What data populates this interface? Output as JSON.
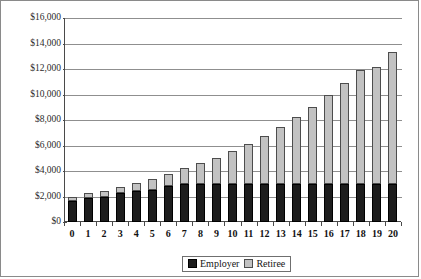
{
  "chart_data": {
    "type": "bar",
    "stacked": true,
    "title": "",
    "xlabel": "",
    "ylabel": "",
    "categories": [
      "0",
      "1",
      "2",
      "3",
      "4",
      "5",
      "6",
      "7",
      "8",
      "9",
      "10",
      "11",
      "12",
      "13",
      "14",
      "15",
      "16",
      "17",
      "18",
      "19",
      "20"
    ],
    "series": [
      {
        "name": "Employer",
        "color": "#1d1d1d",
        "values": [
          1650,
          1900,
          1950,
          2300,
          2450,
          2550,
          2850,
          2950,
          3000,
          3000,
          3000,
          3000,
          3000,
          3000,
          3000,
          3000,
          3000,
          3000,
          3000,
          3000,
          3000
        ]
      },
      {
        "name": "Retiree",
        "color": "#c2c2c2",
        "values": [
          300,
          350,
          450,
          450,
          600,
          850,
          900,
          1250,
          1650,
          2000,
          2550,
          3100,
          3750,
          4450,
          5250,
          6050,
          6950,
          7900,
          8900,
          9150,
          10350
        ]
      }
    ],
    "totals": [
      1950,
      2250,
      2400,
      2750,
      3050,
      3400,
      3750,
      4200,
      4650,
      5000,
      5550,
      6100,
      6750,
      7450,
      8250,
      9050,
      9950,
      10900,
      11900,
      12150,
      13350
    ],
    "ylim": [
      0,
      16000
    ],
    "ytick_values": [
      0,
      2000,
      4000,
      6000,
      8000,
      10000,
      12000,
      14000,
      16000
    ],
    "ytick_labels": [
      "$0",
      "$2,000",
      "$4,000",
      "$6,000",
      "$8,000",
      "$10,000",
      "$12,000",
      "$14,000",
      "$16,000"
    ],
    "grid": true,
    "legend_position": "bottom",
    "legend": [
      {
        "label": "Employer",
        "swatch": "black-square",
        "color": "#1d1d1d"
      },
      {
        "label": "Retiree",
        "swatch": "gray-square",
        "color": "#c2c2c2"
      }
    ]
  }
}
